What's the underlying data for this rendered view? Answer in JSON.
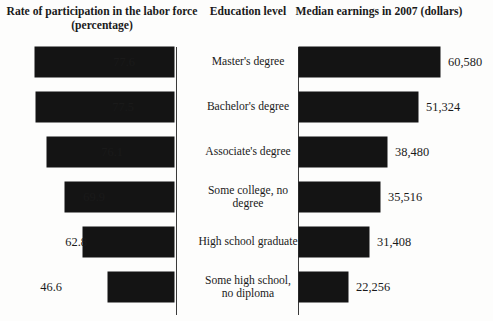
{
  "headers": {
    "left": "Rate of participation in the labor force (percentage)",
    "center": "Education level",
    "right": "Median earnings in 2007 (dollars)"
  },
  "colors": {
    "bar": "#141414",
    "background": "#fdfdfc",
    "axis": "#3a3a3a",
    "text": "#1a1a1a"
  },
  "rows": [
    {
      "level": "Master's degree",
      "participation_label": "77.6",
      "earnings_label": "60,580"
    },
    {
      "level": "Bachelor's degree",
      "participation_label": "77.5",
      "earnings_label": "51,324"
    },
    {
      "level": "Associate's degree",
      "participation_label": "76.1",
      "earnings_label": "38,480"
    },
    {
      "level": "Some college, no degree",
      "participation_label": "35,516-row",
      "participation_label_text": "69.9",
      "earnings_label": "35,516"
    },
    {
      "level": "High school graduate",
      "participation_label": "62.8",
      "earnings_label": "31,408"
    },
    {
      "level": "Some high school, no diploma",
      "participation_label": "46.6",
      "earnings_label": "22,256"
    }
  ],
  "chart_data": {
    "type": "bar",
    "orientation": "horizontal-paired",
    "categories": [
      "Master's degree",
      "Bachelor's degree",
      "Associate's degree",
      "Some college, no degree",
      "High school graduate",
      "Some high school, no diploma"
    ],
    "series": [
      {
        "name": "Rate of participation in the labor force (percentage)",
        "unit": "percent",
        "direction": "right-to-left",
        "values": [
          77.6,
          77.5,
          76.1,
          69.9,
          62.8,
          46.6
        ],
        "labels": [
          "77.6",
          "77.5",
          "76.1",
          "69.9",
          "62.8",
          "46.6"
        ],
        "axis_max": 100,
        "bar_px_lengths": [
          139,
          138,
          127,
          109,
          91,
          66
        ]
      },
      {
        "name": "Median earnings in 2007 (dollars)",
        "unit": "dollars",
        "direction": "left-to-right",
        "values": [
          60580,
          51324,
          38480,
          35516,
          31408,
          22256
        ],
        "labels": [
          "60,580",
          "51,324",
          "38,480",
          "35,516",
          "31,408",
          "22,256"
        ],
        "axis_max": 65000,
        "bar_px_lengths": [
          141,
          119,
          88,
          81,
          70,
          49
        ]
      }
    ],
    "xlabel": "",
    "ylabel": "Education level",
    "grid": false,
    "legend": "none",
    "axis_ticks": []
  }
}
